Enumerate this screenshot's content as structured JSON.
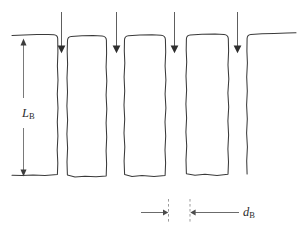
{
  "figure": {
    "kind": "hand-drawn-schematic",
    "background_color": "#ffffff",
    "outline_color": "#3a3a3a",
    "arrow_color": "#2e2e2e",
    "dimension_color": "#4a4a4a",
    "extension_line_color": "#8a8a8a"
  },
  "labels": {
    "block_length": {
      "variable": "L",
      "subscript": "B",
      "full": "L_B",
      "meaning": "block length"
    },
    "block_gap": {
      "variable": "d",
      "subscript": "B",
      "full": "d_B",
      "meaning": "block gap width"
    }
  },
  "blocks": [
    {
      "id": "block-1",
      "x_left": 23,
      "x_right": 58,
      "clipped": "left"
    },
    {
      "id": "block-2",
      "x_left": 66,
      "x_right": 107,
      "clipped": "none"
    },
    {
      "id": "block-3",
      "x_left": 123,
      "x_right": 165,
      "clipped": "none"
    },
    {
      "id": "block-4",
      "x_left": 185,
      "x_right": 228,
      "clipped": "none"
    },
    {
      "id": "block-5",
      "x_left": 246,
      "x_right": 285,
      "clipped": "right"
    }
  ],
  "load_arrows": [
    {
      "id": "load-arrow-1",
      "x": 61,
      "y_top": 12,
      "y_tip": 52
    },
    {
      "id": "load-arrow-2",
      "x": 116,
      "y_top": 12,
      "y_tip": 52
    },
    {
      "id": "load-arrow-3",
      "x": 174,
      "y_top": 12,
      "y_tip": 52
    },
    {
      "id": "load-arrow-4",
      "x": 237,
      "y_top": 12,
      "y_tip": 52
    }
  ],
  "dimensions": {
    "block_length": {
      "orientation": "vertical",
      "x": 23,
      "y_top": 40,
      "y_bottom": 180,
      "double_headed": true
    },
    "block_gap": {
      "orientation": "horizontal",
      "y": 212,
      "left_segment": {
        "x_start": 142,
        "x_tip": 167
      },
      "right_segment": {
        "x_tip": 191,
        "x_end": 238
      },
      "extension_lines_x": [
        168,
        190
      ]
    }
  }
}
